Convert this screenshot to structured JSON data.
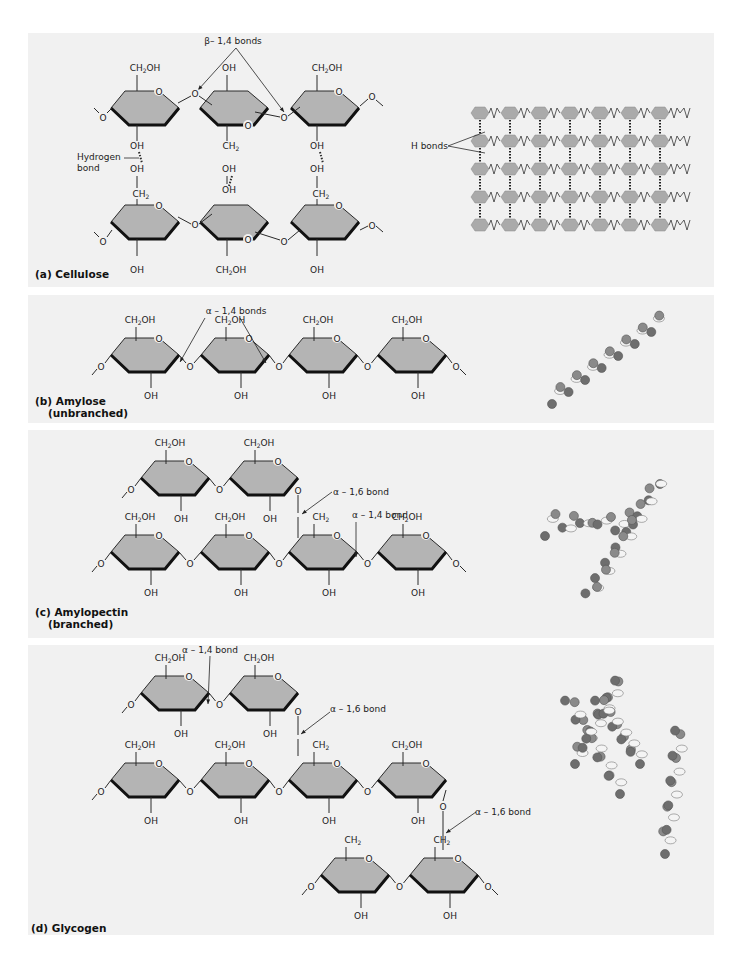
{
  "figure": {
    "header_fragment": "…Biology",
    "panels": [
      {
        "id": "a",
        "label": "(a) Cellulose",
        "annotations": [
          "β– 1,4 bonds",
          "Hydrogen bond",
          "H bonds"
        ],
        "groups": [
          "CH2OH",
          "OH",
          "O",
          "CH2"
        ]
      },
      {
        "id": "b",
        "label": "(b) Amylose",
        "sublabel": "(unbranched)",
        "annotations": [
          "α – 1,4 bonds"
        ]
      },
      {
        "id": "c",
        "label": "(c) Amylopectin",
        "sublabel": "(branched)",
        "annotations": [
          "α – 1,6 bond",
          "α – 1,4 bond"
        ]
      },
      {
        "id": "d",
        "label": "(d) Glycogen",
        "annotations": [
          "α – 1,4 bond",
          "α – 1,6 bond",
          "α – 1,6 bond"
        ]
      }
    ],
    "text": {
      "ch2oh": "CH",
      "oh": "OH",
      "o": "O",
      "ch2": "CH",
      "sub2": "2",
      "oh_suffix": "OH"
    },
    "colors": {
      "panel_bg": "#f1f1f1",
      "ring_fill": "#b4b4b4",
      "ring_stroke": "#2a2a2a",
      "bead_dark": "#6e6e6e",
      "bead_light": "#d6d6d6"
    }
  }
}
